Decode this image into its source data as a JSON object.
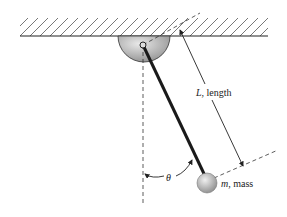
{
  "diagram": {
    "labels": {
      "length_symbol": "L",
      "length_text": ", length",
      "mass_symbol": "m",
      "mass_text": ", mass",
      "angle_symbol": "θ"
    },
    "colors": {
      "line": "#222222",
      "hatch": "#555555",
      "mount_light": "#e6e6e6",
      "mount_dark": "#8a8a8a",
      "bob_light": "#eeeeee",
      "bob_dark": "#8c8c8c",
      "rod": "#1a1a1a",
      "background": "#ffffff"
    }
  }
}
